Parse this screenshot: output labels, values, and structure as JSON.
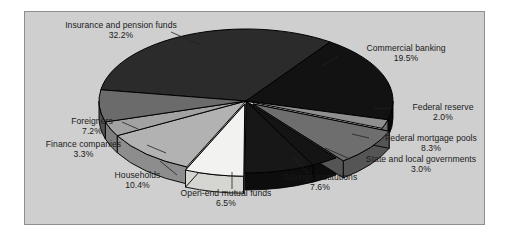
{
  "figure": {
    "panel_background": "#cfcfcf",
    "panel_border": "#8e8e8e"
  },
  "chart_data": {
    "type": "pie",
    "title": "",
    "subtitle": "",
    "xlabel": "",
    "ylabel": "",
    "legend_position": "none",
    "grid": false,
    "style": "3d-exploded",
    "units": "percent",
    "total": 100.0,
    "categories": [
      "Insurance and pension funds",
      "Commercial banking",
      "Federal reserve",
      "Federal mortgage pools",
      "State and local governments",
      "Savings institutions",
      "Open-end mutual funds",
      "Households",
      "Finance companies",
      "Foreigners"
    ],
    "values": [
      32.2,
      19.5,
      2.0,
      8.3,
      3.0,
      7.6,
      6.5,
      10.4,
      3.3,
      7.2
    ],
    "slices": [
      {
        "label": "Insurance and pension funds",
        "value": 32.2,
        "pct_text": "32.2%",
        "color": "#2b2b2b",
        "side_color": "#1a1a1a"
      },
      {
        "label": "Commercial banking",
        "value": 19.5,
        "pct_text": "19.5%",
        "color": "#121212",
        "side_color": "#0a0a0a"
      },
      {
        "label": "Federal reserve",
        "value": 2.0,
        "pct_text": "2.0%",
        "color": "#8f8f8f",
        "side_color": "#6d6d6d"
      },
      {
        "label": "Federal mortgage pools",
        "value": 8.3,
        "pct_text": "8.3%",
        "color": "#6e6e6e",
        "side_color": "#555555"
      },
      {
        "label": "State and local governments",
        "value": 3.0,
        "pct_text": "3.0%",
        "color": "#141414",
        "side_color": "#0c0c0c"
      },
      {
        "label": "Savings institutions",
        "value": 7.6,
        "pct_text": "7.6%",
        "color": "#171717",
        "side_color": "#0d0d0d"
      },
      {
        "label": "Open-end mutual funds",
        "value": 6.5,
        "pct_text": "6.5%",
        "color": "#f2f2f0",
        "side_color": "#d5d5d2"
      },
      {
        "label": "Households",
        "value": 10.4,
        "pct_text": "10.4%",
        "color": "#b2b2b2",
        "side_color": "#8d8d8d"
      },
      {
        "label": "Finance companies",
        "value": 3.3,
        "pct_text": "3.3%",
        "color": "#a2a2a2",
        "side_color": "#7f7f7f"
      },
      {
        "label": "Foreigners",
        "value": 7.2,
        "pct_text": "7.2%",
        "color": "#6b6b6b",
        "side_color": "#525252"
      }
    ]
  },
  "labels": {
    "insurance": {
      "name": "Insurance and pension funds",
      "pct": "32.2%"
    },
    "commercial": {
      "name": "Commercial banking",
      "pct": "19.5%"
    },
    "fedres": {
      "name": "Federal reserve",
      "pct": "2.0%"
    },
    "mortgage": {
      "name": "Federal mortgage pools",
      "pct": "8.3%"
    },
    "statelocal": {
      "name": "State and local governments",
      "pct": "3.0%"
    },
    "savings": {
      "name": "Savings institutions",
      "pct": "7.6%"
    },
    "openend": {
      "name": "Open-end mutual funds",
      "pct": "6.5%"
    },
    "households": {
      "name": "Households",
      "pct": "10.4%"
    },
    "finance": {
      "name": "Finance companies",
      "pct": "3.3%"
    },
    "foreigners": {
      "name": "Foreigners",
      "pct": "7.2%"
    }
  }
}
